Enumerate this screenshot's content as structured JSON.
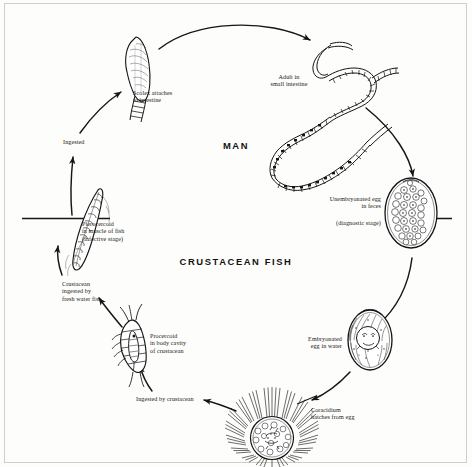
{
  "diagram": {
    "host_labels": [
      {
        "id": "man",
        "text": "MAN",
        "x": 206,
        "y": 140,
        "w": 60
      },
      {
        "id": "crustacean-fish",
        "text": "CRUSTACEAN\nFISH",
        "x": 178,
        "y": 255,
        "w": 116
      }
    ],
    "stages": [
      {
        "id": "adult-in-small-intestine",
        "label": "Adult in\nsmall intestine",
        "x": 258,
        "y": 74,
        "w": 62,
        "align": "center"
      },
      {
        "id": "unembryonated-egg-in-feces",
        "label": "Unembryonated egg\nin feces",
        "x": 303,
        "y": 196,
        "w": 78,
        "align": "right"
      },
      {
        "id": "diagnostic-stage",
        "label": "(diagnostic stage)",
        "x": 303,
        "y": 218,
        "w": 78,
        "align": "right"
      },
      {
        "id": "embryonated-egg-in-water",
        "label": "Embryonated\negg in water",
        "x": 292,
        "y": 336,
        "w": 50,
        "align": "right"
      },
      {
        "id": "coracidium-hatches-from-egg",
        "label": "Coracidium\nhatches from egg",
        "x": 311,
        "y": 407,
        "w": 72,
        "align": "left"
      },
      {
        "id": "ingested-by-crustacean",
        "label": "Ingested by crustacean",
        "x": 136,
        "y": 396,
        "w": 92,
        "align": "left"
      },
      {
        "id": "procercoid-in-body-cavity-of-crustacean",
        "label": "Procercoid\nin body cavity\nof crustacean",
        "x": 136,
        "y": 333,
        "w": 62,
        "align": "left"
      },
      {
        "id": "crustacean-ingested-by-fresh-water-fish",
        "label": "Crustacean\ningested by\nfresh water fish",
        "x": 62,
        "y": 281,
        "w": 66,
        "align": "left"
      },
      {
        "id": "plerocercoid-in-muscle-of-fish",
        "label": "Plerocercoid\nin muscle of fish\n(infective stage)",
        "x": 82,
        "y": 220,
        "w": 72,
        "align": "left"
      },
      {
        "id": "ingested",
        "label": "Ingested",
        "x": 63,
        "y": 139,
        "w": 40,
        "align": "left"
      },
      {
        "id": "scolex-attaches-to-intestine",
        "label": "Scolex attaches\nto intestine",
        "x": 133,
        "y": 90,
        "w": 62,
        "align": "left"
      }
    ],
    "colors": {
      "ink": "#151515",
      "frame": "#cfcfc8",
      "background": "#fdfdfb",
      "waterline": "#171717"
    }
  }
}
